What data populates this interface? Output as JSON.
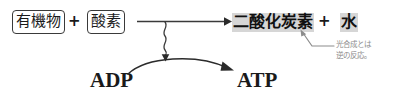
{
  "diagram": {
    "background_color": "#ffffff",
    "highlight_color": "#d6d6d6",
    "ink_color": "#1a1a1a",
    "annotation_color": "#8c8c8c",
    "reactants": {
      "first": {
        "label": "有機物",
        "boxed": true
      },
      "operator": "+",
      "second": {
        "label": "酸素",
        "boxed": true
      }
    },
    "products": {
      "first": {
        "label": "二酸化炭素",
        "highlighted": true
      },
      "operator": "+",
      "second": {
        "label": "水",
        "highlighted": true
      }
    },
    "energy_cycle": {
      "from": "ADP",
      "to": "ATP"
    },
    "annotation": {
      "line1": "光合成とは",
      "line2": "逆の反応。"
    },
    "icons": {
      "main_arrow": "right-arrow-icon",
      "wavy_connector": "wavy-arrow-icon",
      "energy_arc": "curved-arrow-icon",
      "leader": "leader-line-arrow-icon"
    }
  }
}
